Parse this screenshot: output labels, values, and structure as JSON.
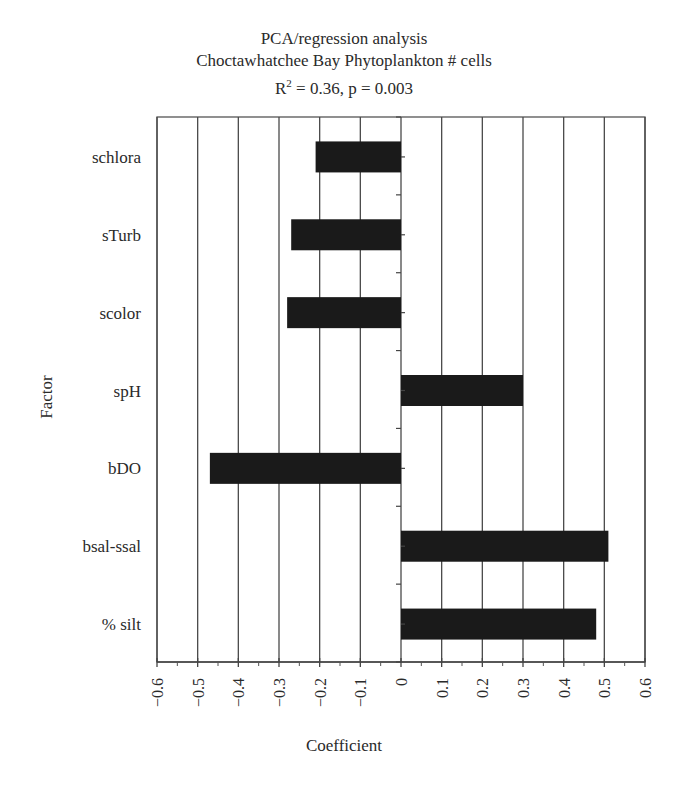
{
  "chart_data": {
    "type": "bar",
    "orientation": "horizontal",
    "title": "PCA/regression analysis",
    "subtitle": "Choctawhatchee Bay Phytoplankton # cells",
    "stats": {
      "r2_label": "R",
      "r2_sup": "2",
      "r2_text": " = 0.36, p = 0.003"
    },
    "xlabel": "Coefficient",
    "ylabel": "Factor",
    "xlim": [
      -0.6,
      0.6
    ],
    "xticks": [
      "−0.6",
      "−0.5",
      "−0.4",
      "−0.3",
      "−0.2",
      "−0.1",
      "0",
      "0.1",
      "0.2",
      "0.3",
      "0.4",
      "0.5",
      "0.6"
    ],
    "xtick_values": [
      -0.6,
      -0.5,
      -0.4,
      -0.3,
      -0.2,
      -0.1,
      0,
      0.1,
      0.2,
      0.3,
      0.4,
      0.5,
      0.6
    ],
    "grid": "vertical",
    "legend": "none",
    "bar_color": "#1a1a1a",
    "categories": [
      "schlora",
      "sTurb",
      "scolor",
      "spH",
      "bDO",
      "bsal-ssal",
      "% silt"
    ],
    "values": [
      -0.21,
      -0.27,
      -0.28,
      0.3,
      -0.47,
      0.51,
      0.48
    ]
  }
}
